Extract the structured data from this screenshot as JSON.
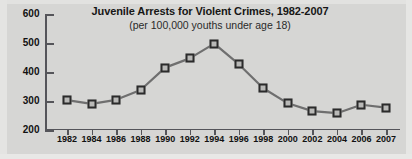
{
  "figure": {
    "background_color": "#d6d6d4",
    "line_color": "#6f6f6f",
    "marker_border_color": "#2b2b2b",
    "marker_fill_color": "#b9b9b7",
    "axis_color": "#55555a"
  },
  "chart_data": {
    "type": "line",
    "title": "Juvenile Arrests for Violent Crimes, 1982-2007",
    "subtitle": "(per 100,000 youths under age 18)",
    "xlabel": "",
    "ylabel": "",
    "categories": [
      "1982",
      "1984",
      "1986",
      "1988",
      "1990",
      "1992",
      "1994",
      "1996",
      "1998",
      "2000",
      "2002",
      "2004",
      "2006",
      "2007"
    ],
    "values": [
      303,
      290,
      304,
      338,
      415,
      447,
      498,
      427,
      344,
      292,
      265,
      258,
      287,
      277
    ],
    "ylim": [
      200,
      600
    ],
    "yticks": [
      200,
      300,
      400,
      500,
      600
    ],
    "ytick_labels": [
      "200",
      "300",
      "400",
      "500",
      "600"
    ],
    "grid": false,
    "legend": false,
    "marker": "square",
    "series_name": "Juvenile arrest rate per 100,000 youths under age 18"
  }
}
